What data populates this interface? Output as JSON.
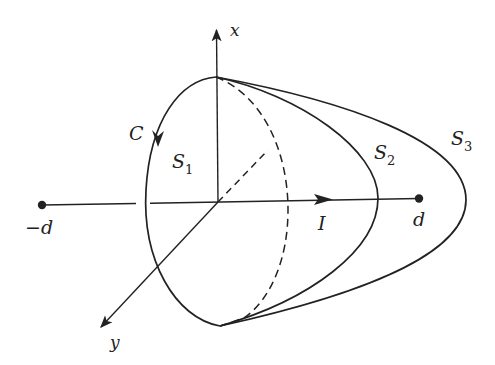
{
  "figure": {
    "colors": {
      "ink": "#222222",
      "background": "#ffffff"
    }
  },
  "axes": {
    "x_label": "x",
    "y_label": "y"
  },
  "loop": {
    "label": "C"
  },
  "surfaces": [
    {
      "name": "S",
      "sub": "1"
    },
    {
      "name": "S",
      "sub": "2"
    },
    {
      "name": "S",
      "sub": "3"
    }
  ],
  "current": {
    "label": "I"
  },
  "points": [
    {
      "label": "−d"
    },
    {
      "label": "d"
    }
  ]
}
